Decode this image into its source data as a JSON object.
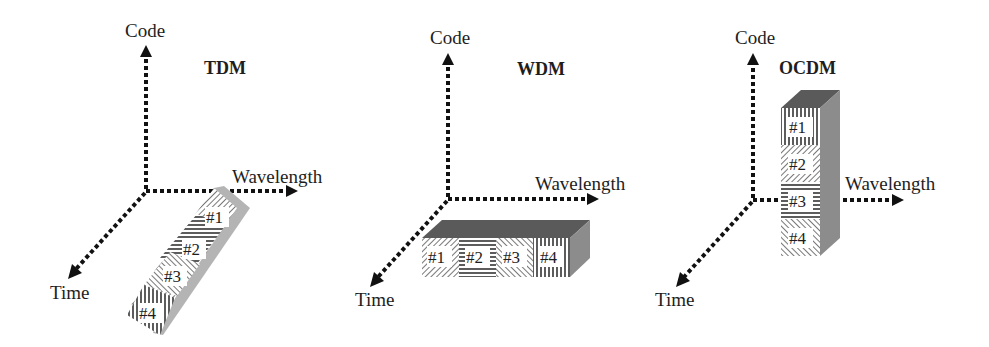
{
  "figure": {
    "panels": [
      {
        "id": "tdm",
        "title": "TDM",
        "axes": {
          "code": "Code",
          "wavelength": "Wavelength",
          "time": "Time"
        },
        "slots": [
          "#1",
          "#2",
          "#3",
          "#4"
        ],
        "arrangement": "stacked along time axis"
      },
      {
        "id": "wdm",
        "title": "WDM",
        "axes": {
          "code": "Code",
          "wavelength": "Wavelength",
          "time": "Time"
        },
        "slots": [
          "#1",
          "#2",
          "#3",
          "#4"
        ],
        "arrangement": "stacked along wavelength axis"
      },
      {
        "id": "ocdm",
        "title": "OCDM",
        "axes": {
          "code": "Code",
          "wavelength": "Wavelength",
          "time": "Time"
        },
        "slots": [
          "#1",
          "#2",
          "#3",
          "#4"
        ],
        "arrangement": "stacked along code axis"
      }
    ]
  },
  "colors": {
    "axis": "#111111",
    "box_top": "#5a5a5a",
    "box_side": "#8c8c8c",
    "tdm_side": "#b4b4b4",
    "text": "#1e1e1e"
  }
}
